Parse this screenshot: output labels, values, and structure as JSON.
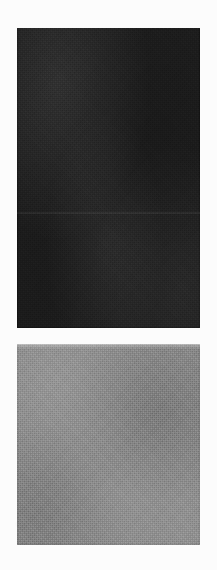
{
  "page": {
    "width": 217,
    "height": 570,
    "background_color": "#fcfcfc",
    "media": "scanned paper page",
    "text_content": ""
  },
  "patches": [
    {
      "name": "dark-patch",
      "label": "",
      "tone": "near-black",
      "fill_color": "#1d1d1d",
      "x": 17,
      "y": 28,
      "width": 183,
      "height": 300,
      "texture": "scan grain / halftone dither",
      "seam_offset_y": 184
    },
    {
      "name": "gray-patch",
      "label": "",
      "tone": "mid-gray",
      "fill_color": "#8b8b8b",
      "x": 17,
      "y": 344,
      "width": 183,
      "height": 201,
      "texture": "scan grain / halftone dither",
      "seam_offset_y": null
    }
  ],
  "gap": {
    "name": "patch-gap",
    "color": "#fcfcfc",
    "y": 328,
    "height": 16
  }
}
